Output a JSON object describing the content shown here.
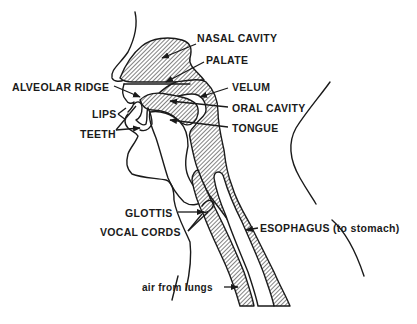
{
  "diagram": {
    "colors": {
      "ink": "#1a1a1a",
      "background": "#ffffff"
    },
    "labels": {
      "nasal_cavity": "NASAL CAVITY",
      "palate": "PALATE",
      "alveolar_ridge": "ALVEOLAR RIDGE",
      "velum": "VELUM",
      "oral_cavity": "ORAL CAVITY",
      "lips": "LIPS",
      "teeth": "TEETH",
      "tongue": "TONGUE",
      "glottis": "GLOTTIS",
      "vocal_cords": "VOCAL CORDS",
      "esophagus": "ESOPHAGUS (to stomach)",
      "air_from_lungs": "air from lungs"
    }
  }
}
